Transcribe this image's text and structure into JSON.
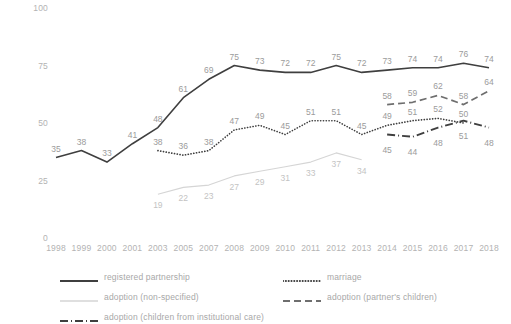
{
  "chart_data": {
    "type": "line",
    "title": "",
    "subtitle": "",
    "xlabel": "",
    "ylabel": "",
    "ylim": [
      0,
      100
    ],
    "yticks": [
      0,
      25,
      50,
      75,
      100
    ],
    "grid": false,
    "legend_position": "bottom",
    "categories": [
      "1998",
      "1999",
      "2000",
      "2001",
      "2003",
      "2005",
      "2007",
      "2008",
      "2009",
      "2010",
      "2011",
      "2012",
      "2013",
      "2014",
      "2015",
      "2016",
      "2017",
      "2018"
    ],
    "series": [
      {
        "name": "registered partnership",
        "style": "solid",
        "color": "#3f3f3f",
        "values": [
          35,
          38,
          33,
          41,
          48,
          61,
          69,
          75,
          73,
          72,
          72,
          75,
          72,
          73,
          74,
          74,
          76,
          74
        ]
      },
      {
        "name": "marriage",
        "style": "dotted",
        "color": "#3f3f3f",
        "values": [
          null,
          null,
          null,
          null,
          38,
          36,
          38,
          47,
          49,
          45,
          51,
          51,
          45,
          49,
          51,
          52,
          50,
          null
        ]
      },
      {
        "name": "adoption (non-specified)",
        "style": "solid-light",
        "color": "#d5d5d5",
        "values": [
          null,
          null,
          null,
          null,
          19,
          22,
          23,
          27,
          29,
          31,
          33,
          37,
          34,
          null,
          null,
          null,
          null,
          null
        ]
      },
      {
        "name": "adoption (partner's children)",
        "style": "dashed",
        "color": "#6e6e6e",
        "values": [
          null,
          null,
          null,
          null,
          null,
          null,
          null,
          null,
          null,
          null,
          null,
          null,
          null,
          58,
          59,
          62,
          58,
          64
        ]
      },
      {
        "name": "adoption (children from institutional care)",
        "style": "dash-dot",
        "color": "#3f3f3f",
        "values": [
          null,
          null,
          null,
          null,
          null,
          null,
          null,
          null,
          null,
          null,
          null,
          null,
          null,
          45,
          44,
          48,
          51,
          48
        ]
      }
    ]
  },
  "legend": {
    "items": [
      {
        "label": "registered partnership",
        "marker": "solid-line-marker"
      },
      {
        "label": "marriage",
        "marker": "dotted-line-marker"
      },
      {
        "label": "adoption (non-specified)",
        "marker": "light-solid-line-marker"
      },
      {
        "label": "adoption (partner's children)",
        "marker": "dashed-line-marker"
      },
      {
        "label": "adoption (children from institutional care)",
        "marker": "dash-dot-line-marker"
      }
    ]
  }
}
